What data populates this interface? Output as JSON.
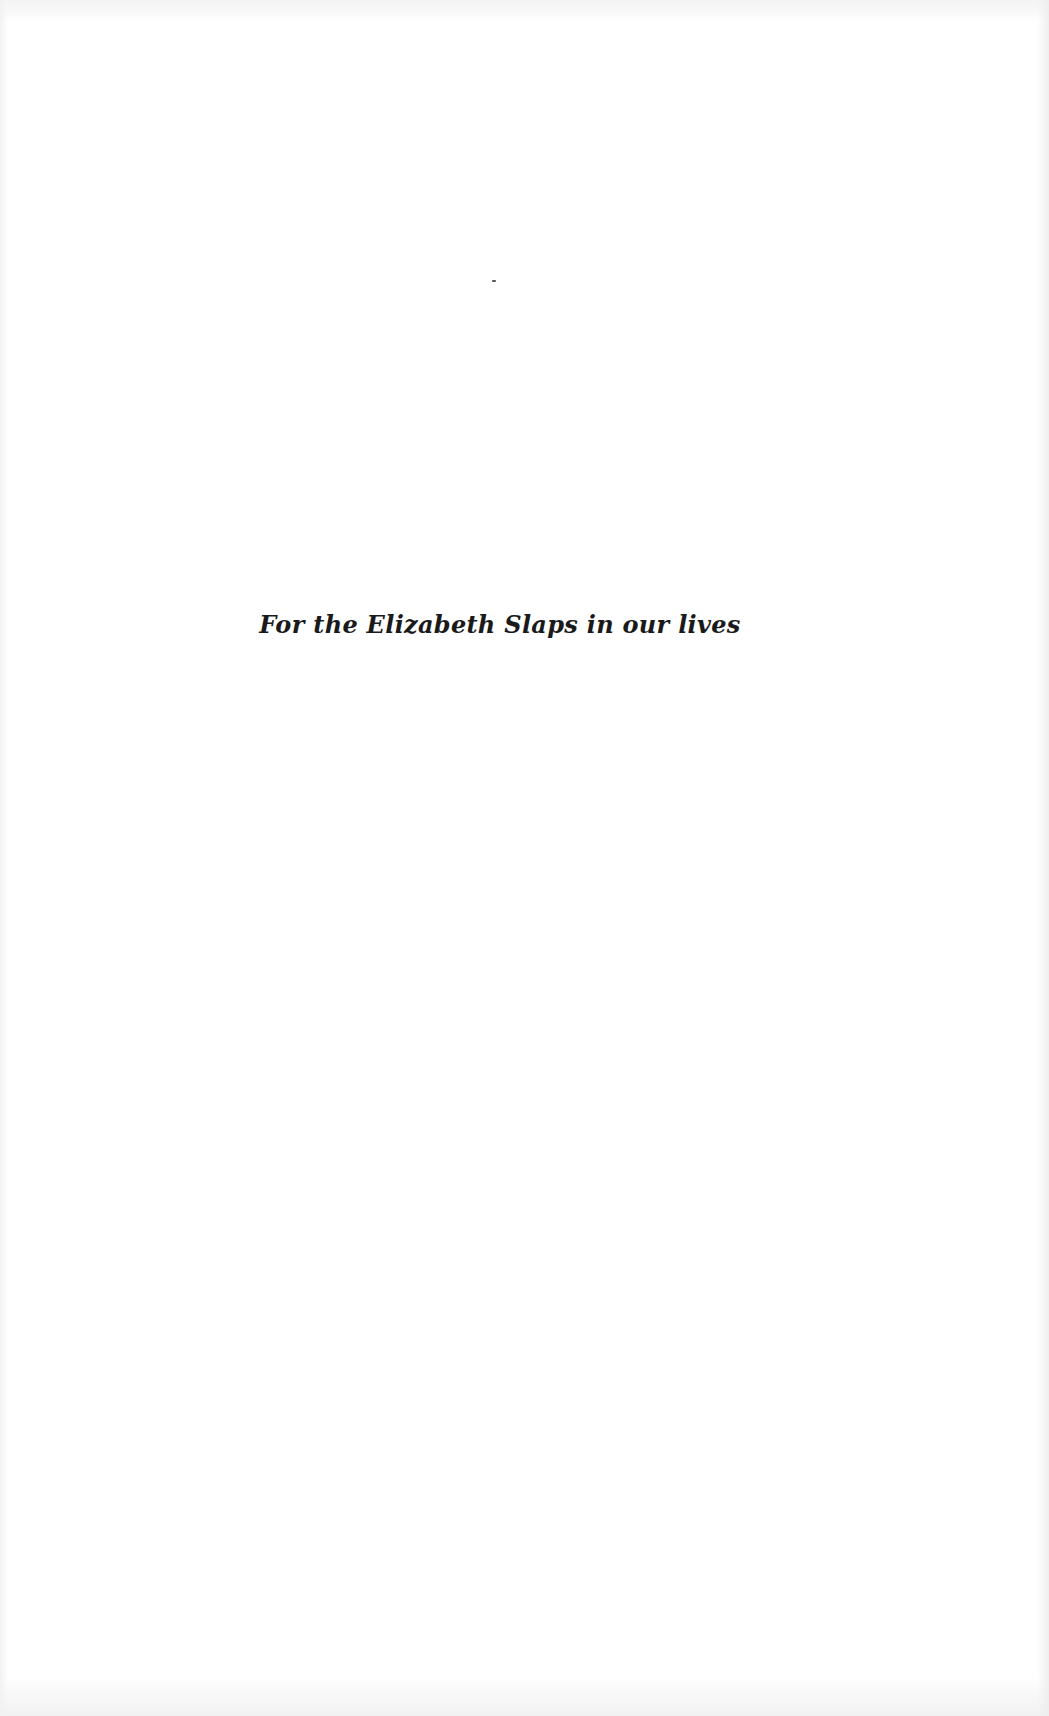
{
  "page": {
    "type": "dedication",
    "dedication_text": "For the Elizabeth Slaps in our lives",
    "background_color": "#ffffff",
    "text_color": "#1a1a1a"
  }
}
